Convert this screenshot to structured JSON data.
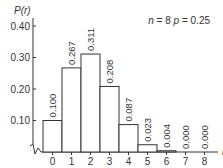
{
  "chart_data": {
    "type": "bar",
    "title": "",
    "annotation": {
      "n_label": "n",
      "n_value": "8",
      "p_label": "p",
      "p_value": "0.25",
      "text": "n = 8   p = 0.25"
    },
    "xlabel": "r",
    "ylabel": "P(r)",
    "categories": [
      "0",
      "1",
      "2",
      "3",
      "4",
      "5",
      "6",
      "7",
      "8"
    ],
    "values": [
      0.1,
      0.267,
      0.311,
      0.208,
      0.087,
      0.023,
      0.004,
      0.0,
      0.0
    ],
    "value_labels": [
      "0.100",
      "0.267",
      "0.311",
      "0.208",
      "0.087",
      "0.023",
      "0.004",
      "0.000",
      "0.000"
    ],
    "yticks": [
      "0.10",
      "0.20",
      "0.30",
      "0.40"
    ],
    "ylim": [
      0,
      0.4
    ],
    "grid": false,
    "axis_break": true
  }
}
